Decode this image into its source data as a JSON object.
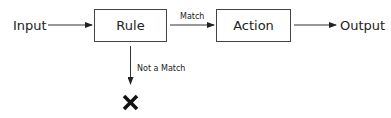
{
  "diagram": {
    "input_label": "Input",
    "rule_label": "Rule",
    "match_label": "Match",
    "action_label": "Action",
    "output_label": "Output",
    "not_match_label": "Not a Match",
    "reject_icon": "x-mark-icon"
  },
  "colors": {
    "stroke": "#333333",
    "text": "#222222",
    "background": "#ffffff"
  }
}
